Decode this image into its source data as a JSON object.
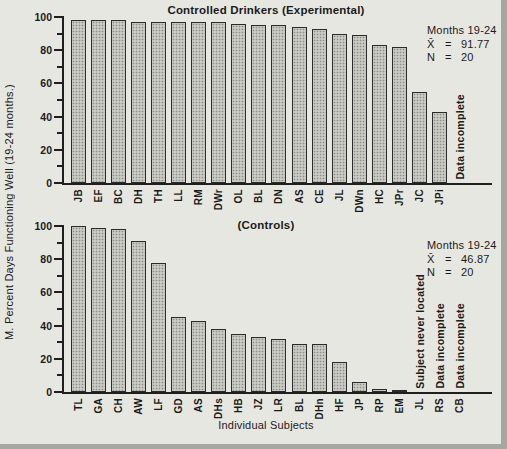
{
  "chart_data": [
    {
      "type": "bar",
      "title": "Controlled Drinkers (Experimental)",
      "categories": [
        "JB",
        "EF",
        "BC",
        "DH",
        "TH",
        "LL",
        "RM",
        "DWr",
        "OL",
        "BL",
        "DN",
        "AS",
        "CE",
        "JL",
        "DWn",
        "HC",
        "JPr",
        "JC",
        "JPi",
        ""
      ],
      "values": [
        98,
        98,
        98,
        97,
        97,
        97,
        97,
        97,
        96,
        95,
        95,
        94,
        93,
        90,
        89,
        83,
        82,
        55,
        43,
        null
      ],
      "bar_notes": [
        {
          "index": 19,
          "text": "Data incomplete"
        }
      ],
      "ylabel": "M. Percent Days Functioning Well (19-24 months.)",
      "xlabel": "",
      "ylim": [
        0,
        100
      ],
      "ytick_step": 20,
      "minor_tick_step": 10,
      "grid": false,
      "legend": "none",
      "annotation": {
        "period": "Months 19-24",
        "mean_symbol": "X̄",
        "eq": "=",
        "mean_value": "91.77",
        "n_symbol": "N",
        "n_value": "20"
      }
    },
    {
      "type": "bar",
      "title": "(Controls)",
      "categories": [
        "TL",
        "GA",
        "CH",
        "AW",
        "LF",
        "GD",
        "AS",
        "DHs",
        "HB",
        "JZ",
        "LR",
        "BL",
        "DHn",
        "HF",
        "JP",
        "RP",
        "EM",
        "JL",
        "RS",
        "CB"
      ],
      "values": [
        100,
        99,
        98,
        91,
        78,
        45,
        43,
        38,
        35,
        33,
        32,
        29,
        29,
        18,
        6,
        2,
        1,
        null,
        null,
        null
      ],
      "bar_notes": [
        {
          "index": 17,
          "text": "Subject never located"
        },
        {
          "index": 18,
          "text": "Data incomplete"
        },
        {
          "index": 19,
          "text": "Data incomplete"
        }
      ],
      "ylabel": "",
      "xlabel": "Individual Subjects",
      "ylim": [
        0,
        100
      ],
      "ytick_step": 20,
      "minor_tick_step": 10,
      "grid": false,
      "legend": "none",
      "annotation": {
        "period": "Months 19-24",
        "mean_symbol": "X̄",
        "eq": "=",
        "mean_value": "46.87",
        "n_symbol": "N",
        "n_value": "20"
      }
    }
  ],
  "colors": {
    "background": "#e7e7e2",
    "bar_fill": "#cbcbc5",
    "bar_pattern_dot": "#8d8d87",
    "axis": "#1f1f1f",
    "text": "#1a1a1a",
    "scan_edge": "#a7a7a2"
  }
}
